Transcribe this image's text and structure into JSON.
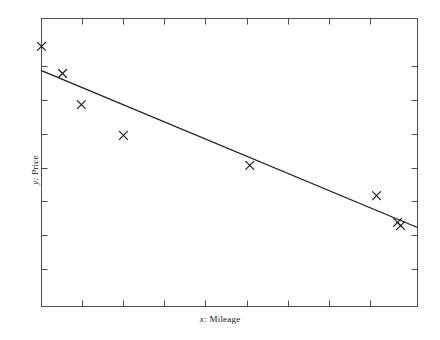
{
  "figure": {
    "background_color": "#ffffff",
    "frame_color": "#4d4d4d",
    "marker_color": "#1a1a1a",
    "line_color": "#1a1a1a"
  },
  "axis_labels": {
    "x_prefix": "x:",
    "x_name": "Mileage",
    "y_prefix": "y:",
    "y_name": "Price"
  },
  "chart_data": {
    "type": "scatter",
    "title": "",
    "xlabel": "x: Mileage",
    "ylabel": "y: Price",
    "grid": false,
    "legend": "none",
    "axis_tick_labels": {
      "x": [],
      "y": []
    },
    "xlim": [
      0,
      100
    ],
    "ylim": [
      0,
      100
    ],
    "points": [
      {
        "x": 0.0,
        "y": 90.3
      },
      {
        "x": 5.6,
        "y": 80.9
      },
      {
        "x": 10.6,
        "y": 70.1
      },
      {
        "x": 21.8,
        "y": 59.4
      },
      {
        "x": 55.4,
        "y": 49.0
      },
      {
        "x": 89.1,
        "y": 38.5
      },
      {
        "x": 94.7,
        "y": 29.2
      },
      {
        "x": 95.5,
        "y": 28.1
      }
    ],
    "fit_line": {
      "type": "linear-regression",
      "x_start": 0.0,
      "y_start": 81.9,
      "x_end": 100.0,
      "y_end": 27.4
    },
    "ticks": {
      "x_count": 9,
      "y_count": 8,
      "direction": "inward",
      "sides": [
        "top",
        "bottom",
        "left",
        "right"
      ]
    }
  }
}
